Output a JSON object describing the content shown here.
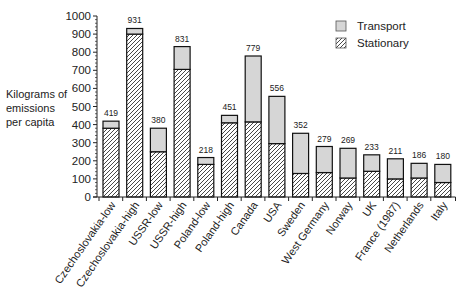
{
  "chart_data": {
    "type": "bar",
    "stacked": true,
    "title": "",
    "xlabel": "",
    "ylabel": "Kilograms of emissions per capita",
    "ylabel_lines": [
      "Kilograms of",
      "emissions",
      "per capita"
    ],
    "ylim": [
      0,
      1000
    ],
    "yticks": [
      0,
      100,
      200,
      300,
      400,
      500,
      600,
      700,
      800,
      900,
      1000
    ],
    "grid": false,
    "legend_position": "top-right",
    "categories": [
      "Czechoslovakia-low",
      "Czechoslovakia-high",
      "USSR-low",
      "USSR-high",
      "Poland-low",
      "Poland-high",
      "Canada",
      "USA",
      "Sweden",
      "West Germany",
      "Norway",
      "UK",
      "France (1987)",
      "Netherlands",
      "Italy"
    ],
    "totals": [
      419,
      931,
      380,
      831,
      218,
      451,
      779,
      556,
      352,
      279,
      269,
      233,
      211,
      186,
      180
    ],
    "series": [
      {
        "name": "Stationary",
        "pattern": "hatched",
        "values": [
          380,
          900,
          250,
          705,
          180,
          410,
          415,
          295,
          130,
          135,
          105,
          142,
          100,
          105,
          80
        ]
      },
      {
        "name": "Transport",
        "pattern": "light-gray",
        "values": [
          39,
          31,
          130,
          126,
          38,
          41,
          364,
          261,
          222,
          144,
          164,
          91,
          111,
          81,
          100
        ]
      }
    ],
    "colors": {
      "transport_fill": "#d6d6d6",
      "hatch": "#333333",
      "outline": "#111111"
    }
  },
  "legend": {
    "items": [
      {
        "label": "Transport",
        "swatch": "light-gray"
      },
      {
        "label": "Stationary",
        "swatch": "hatched"
      }
    ]
  }
}
